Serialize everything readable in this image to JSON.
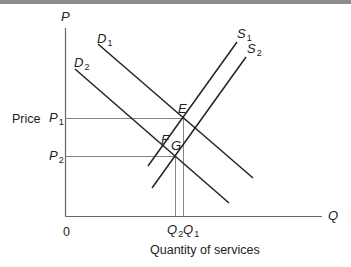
{
  "diagram": {
    "type": "supply-demand",
    "axes": {
      "y_label": "P",
      "x_label": "Q",
      "origin_label": "0",
      "y_title": "Price",
      "x_title": "Quantity of services"
    },
    "curves": {
      "D1": {
        "name": "D",
        "sub": "1"
      },
      "D2": {
        "name": "D",
        "sub": "2"
      },
      "S1": {
        "name": "S",
        "sub": "1"
      },
      "S2": {
        "name": "S",
        "sub": "2"
      }
    },
    "prices": {
      "P1": {
        "name": "P",
        "sub": "1"
      },
      "P2": {
        "name": "P",
        "sub": "2"
      }
    },
    "quantities": {
      "Q1": {
        "name": "Q",
        "sub": "1"
      },
      "Q2": {
        "name": "Q",
        "sub": "2"
      }
    },
    "points": {
      "E": "E",
      "F": "F",
      "G": "G"
    },
    "colors": {
      "line": "#222222",
      "guide": "#777777",
      "axis": "#666666",
      "topbar": "#8c8c8c"
    }
  }
}
